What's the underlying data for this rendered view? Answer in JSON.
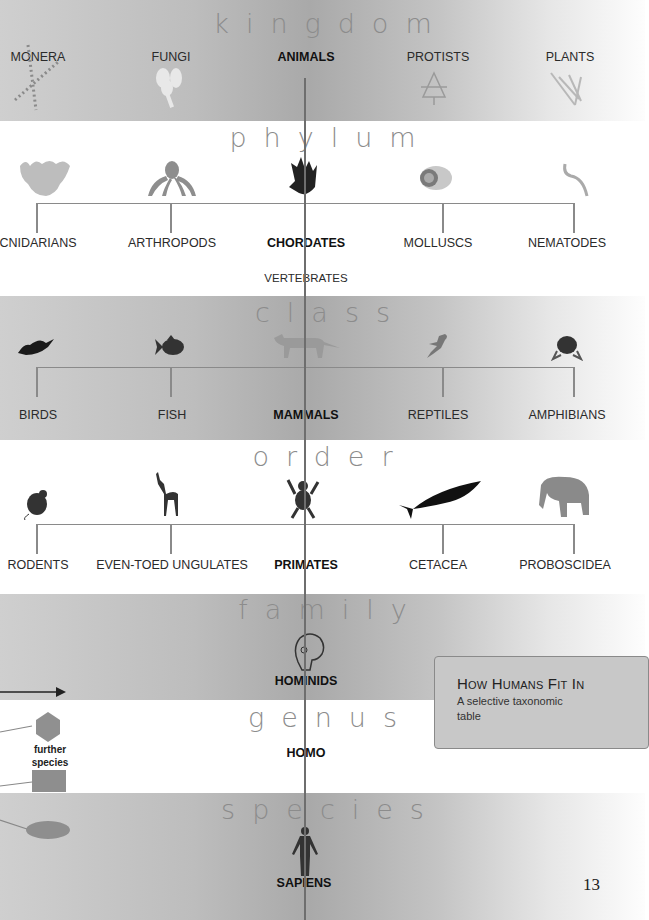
{
  "page": {
    "title": "How Humans Fit In",
    "subtitle": "A selective taxonomic table",
    "page_number": "13"
  },
  "ranks": [
    {
      "name": "kingdom",
      "items": [
        "MONERA",
        "FUNGI",
        "ANIMALS",
        "PROTISTS",
        "PLANTS"
      ],
      "selected": "ANIMALS"
    },
    {
      "name": "phylum",
      "items": [
        "CNIDARIANS",
        "ARTHROPODS",
        "CHORDATES",
        "MOLLUSCS",
        "NEMATODES"
      ],
      "selected": "CHORDATES",
      "sub": "VERTEBRATES"
    },
    {
      "name": "class",
      "items": [
        "BIRDS",
        "FISH",
        "MAMMALS",
        "REPTILES",
        "AMPHIBIANS"
      ],
      "selected": "MAMMALS"
    },
    {
      "name": "order",
      "items": [
        "RODENTS",
        "EVEN-TOED UNGULATES",
        "PRIMATES",
        "CETACEA",
        "PROBOSCIDEA"
      ],
      "selected": "PRIMATES"
    },
    {
      "name": "family",
      "items": [
        "HOMINIDS"
      ],
      "selected": "HOMINIDS"
    },
    {
      "name": "genus",
      "items": [
        "HOMO"
      ],
      "selected": "HOMO"
    },
    {
      "name": "species",
      "items": [
        "SAPIENS"
      ],
      "selected": "SAPIENS"
    }
  ],
  "legend": {
    "further_species": "further species"
  },
  "colors": {
    "band_dark": "#b5b5b5",
    "spine": "#6e6e6e",
    "box": "#c8c8c8",
    "text": "#222222"
  }
}
